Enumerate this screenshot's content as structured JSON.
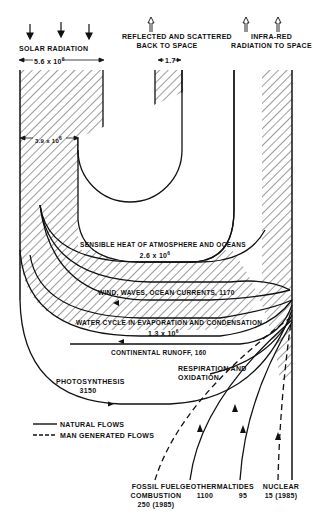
{
  "diagram": {
    "type": "energy flow diagram",
    "units_note": "",
    "top_labels": {
      "solar_radiation": "SOLAR RADIATION",
      "solar_value": "5.6 x 10",
      "solar_exp": "6",
      "reflected_line1": "REFLECTED AND SCATTERED",
      "reflected_line2": "BACK TO SPACE",
      "reflected_value": "1.7",
      "infrared_line1": "INFRA-RED",
      "infrared_line2": "RADIATION TO SPACE"
    },
    "absorbed": {
      "value": "3.9 x 10",
      "exp": "6"
    },
    "flows": [
      {
        "id": "sensible-heat",
        "label": "SENSIBLE HEAT OF ATMOSPHERE AND OCEANS",
        "value": "2.6 x 10",
        "exp": "6",
        "kind": "natural"
      },
      {
        "id": "wind",
        "label": "WIND, WAVES, OCEAN CURRENTS, 1170",
        "kind": "natural"
      },
      {
        "id": "water-cycle",
        "label": "WATER CYCLE IN EVAPORATION AND CONDENSATION",
        "value": "1.3 x 10",
        "exp": "6",
        "kind": "natural"
      },
      {
        "id": "runoff",
        "label": "CONTINENTAL RUNOFF, 160",
        "kind": "natural"
      },
      {
        "id": "photosynthesis",
        "label": "PHOTOSYNTHESIS",
        "value": "3150",
        "kind": "natural"
      },
      {
        "id": "respiration",
        "label_line1": "RESPIRATION AND",
        "label_line2": "OXIDATION",
        "kind": "natural"
      }
    ],
    "sources": [
      {
        "id": "fossil",
        "line1": "FOSSIL FUEL",
        "line2": "COMBUSTION",
        "line3": "250 (1985)",
        "kind": "man-generated"
      },
      {
        "id": "geothermal",
        "line1": "GEOTHERMAL",
        "line2": "1100",
        "kind": "natural"
      },
      {
        "id": "tides",
        "line1": "TIDES",
        "line2": "95",
        "kind": "natural"
      },
      {
        "id": "nuclear",
        "line1": "NUCLEAR",
        "line2": "15 (1985)",
        "kind": "man-generated"
      }
    ],
    "legend": {
      "natural": "NATURAL FLOWS",
      "man_generated": "MAN GENERATED FLOWS"
    }
  }
}
